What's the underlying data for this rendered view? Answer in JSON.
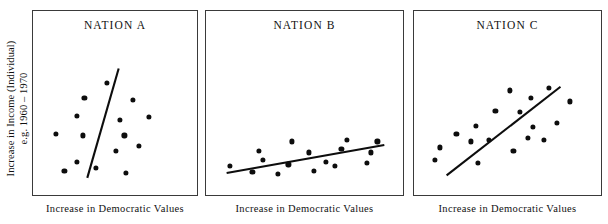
{
  "figure": {
    "shared_y_axis_label_line1": "Increase in Income (Individual)",
    "shared_y_axis_label_line2": "e.g. 1960 – 1970",
    "panel_titles": [
      "NATION A",
      "NATION B",
      "NATION C"
    ],
    "x_axis_labels": [
      "Increase in Democratic Values",
      "Increase in Democratic Values",
      "Increase in Democratic Values"
    ],
    "ink_color": "#0d0d0d",
    "frame_color": "#3a3a3a",
    "background_color": "#ffffff"
  },
  "chart_data": [
    {
      "type": "scatter",
      "title": "NATION A",
      "xlabel": "Increase in Democratic Values",
      "ylabel": "Increase in Income (Individual) e.g. 1960 – 1970",
      "xlim": [
        0,
        100
      ],
      "ylim": [
        0,
        100
      ],
      "grid": false,
      "legend": "none",
      "axis_ticks": "none",
      "points": [
        {
          "x": 44,
          "y": 80
        },
        {
          "x": 28,
          "y": 68
        },
        {
          "x": 62,
          "y": 66
        },
        {
          "x": 23,
          "y": 53
        },
        {
          "x": 53,
          "y": 50
        },
        {
          "x": 73,
          "y": 52
        },
        {
          "x": 8,
          "y": 38
        },
        {
          "x": 27,
          "y": 37
        },
        {
          "x": 56,
          "y": 37
        },
        {
          "x": 50,
          "y": 24
        },
        {
          "x": 23,
          "y": 15
        },
        {
          "x": 36,
          "y": 10
        },
        {
          "x": 14,
          "y": 8
        },
        {
          "x": 57,
          "y": 6
        },
        {
          "x": 66,
          "y": 28
        }
      ],
      "trendline": {
        "x1": 30,
        "y1": 2,
        "x2": 52,
        "y2": 92,
        "slope_description": "steep, near-vertical; weak relationship"
      }
    },
    {
      "type": "scatter",
      "title": "NATION B",
      "xlabel": "Increase in Democratic Values",
      "ylabel": "Increase in Income (Individual) e.g. 1960 – 1970",
      "xlim": [
        0,
        100
      ],
      "ylim": [
        0,
        100
      ],
      "grid": false,
      "legend": "none",
      "axis_ticks": "none",
      "points": [
        {
          "x": 42,
          "y": 32
        },
        {
          "x": 74,
          "y": 33
        },
        {
          "x": 92,
          "y": 32
        },
        {
          "x": 23,
          "y": 24
        },
        {
          "x": 52,
          "y": 23
        },
        {
          "x": 71,
          "y": 26
        },
        {
          "x": 88,
          "y": 23
        },
        {
          "x": 25,
          "y": 17
        },
        {
          "x": 62,
          "y": 15
        },
        {
          "x": 40,
          "y": 13
        },
        {
          "x": 67,
          "y": 12
        },
        {
          "x": 86,
          "y": 14
        },
        {
          "x": 6,
          "y": 12
        },
        {
          "x": 19,
          "y": 7
        },
        {
          "x": 34,
          "y": 5
        },
        {
          "x": 55,
          "y": 8
        }
      ],
      "trendline": {
        "x1": 4,
        "y1": 6,
        "x2": 96,
        "y2": 29,
        "slope_description": "shallow positive; moderate relationship"
      }
    },
    {
      "type": "scatter",
      "title": "NATION C",
      "xlabel": "Increase in Democratic Values",
      "ylabel": "Increase in Income (Individual) e.g. 1960 – 1970",
      "xlim": [
        0,
        100
      ],
      "ylim": [
        0,
        100
      ],
      "grid": false,
      "legend": "none",
      "axis_ticks": "none",
      "points": [
        {
          "x": 51,
          "y": 74
        },
        {
          "x": 75,
          "y": 76
        },
        {
          "x": 64,
          "y": 68
        },
        {
          "x": 88,
          "y": 65
        },
        {
          "x": 42,
          "y": 57
        },
        {
          "x": 57,
          "y": 56
        },
        {
          "x": 30,
          "y": 45
        },
        {
          "x": 65,
          "y": 44
        },
        {
          "x": 18,
          "y": 38
        },
        {
          "x": 62,
          "y": 35
        },
        {
          "x": 72,
          "y": 33
        },
        {
          "x": 27,
          "y": 32
        },
        {
          "x": 38,
          "y": 33
        },
        {
          "x": 8,
          "y": 27
        },
        {
          "x": 53,
          "y": 24
        },
        {
          "x": 5,
          "y": 17
        },
        {
          "x": 31,
          "y": 14
        },
        {
          "x": 80,
          "y": 47
        }
      ],
      "trendline": {
        "x1": 12,
        "y1": 4,
        "x2": 82,
        "y2": 77,
        "slope_description": "strong positive ~45°; tight relationship"
      }
    }
  ]
}
